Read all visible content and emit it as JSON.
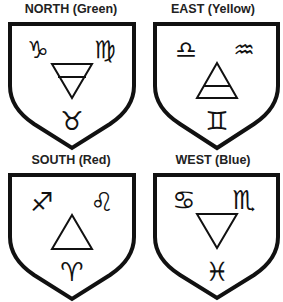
{
  "panels": [
    {
      "id": "north",
      "title": "NORTH (Green)",
      "direction": "North",
      "color_name": "Green",
      "element": "earth",
      "element_symbol": "down-triangle-with-bar",
      "signs": {
        "top_left": "♑",
        "top_right": "♍",
        "bottom": "♉"
      },
      "sign_names": {
        "top_left": "Capricorn",
        "top_right": "Virgo",
        "bottom": "Taurus"
      }
    },
    {
      "id": "east",
      "title": "EAST (Yellow)",
      "direction": "East",
      "color_name": "Yellow",
      "element": "air",
      "element_symbol": "up-triangle-with-bar",
      "signs": {
        "top_left": "♎",
        "top_right": "♒",
        "bottom": "♊"
      },
      "sign_names": {
        "top_left": "Libra",
        "top_right": "Aquarius",
        "bottom": "Gemini"
      }
    },
    {
      "id": "south",
      "title": "SOUTH (Red)",
      "direction": "South",
      "color_name": "Red",
      "element": "fire",
      "element_symbol": "up-triangle",
      "signs": {
        "top_left": "♐",
        "top_right": "♌",
        "bottom": "♈"
      },
      "sign_names": {
        "top_left": "Sagittarius",
        "top_right": "Leo",
        "bottom": "Aries"
      }
    },
    {
      "id": "west",
      "title": "WEST (Blue)",
      "direction": "West",
      "color_name": "Blue",
      "element": "water",
      "element_symbol": "down-triangle",
      "signs": {
        "top_left": "♋",
        "top_right": "♏",
        "bottom": "♓"
      },
      "sign_names": {
        "top_left": "Cancer",
        "top_right": "Scorpio",
        "bottom": "Pisces"
      }
    }
  ]
}
